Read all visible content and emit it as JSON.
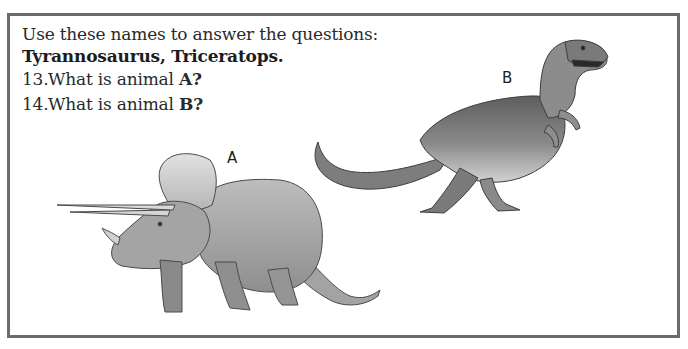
{
  "worksheet": {
    "instruction": "Use these names to answer the questions:",
    "names": "Tyrannosaurus, Triceratops.",
    "questions": [
      {
        "number": "13.",
        "text": "What is animal ",
        "target": "A?"
      },
      {
        "number": "14.",
        "text": "What is animal ",
        "target": "B?"
      }
    ]
  },
  "figures": {
    "label_a": "A",
    "label_b": "B",
    "animal_a": "triceratops-illustration",
    "animal_b": "tyrannosaurus-illustration"
  },
  "colors": {
    "border": "#6b6b6b",
    "text": "#2a2a2a",
    "illustration_dark": "#5a5a5a",
    "illustration_light": "#c9c9c9"
  }
}
